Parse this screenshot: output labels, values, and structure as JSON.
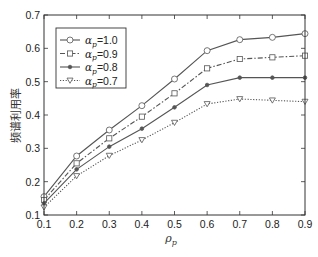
{
  "chart_data": {
    "type": "line",
    "title": "",
    "xlabel": "ρ_p",
    "ylabel": "频谱利用率",
    "x": [
      0.1,
      0.2,
      0.3,
      0.4,
      0.5,
      0.6,
      0.7,
      0.8,
      0.9
    ],
    "xlim": [
      0.1,
      0.9
    ],
    "ylim": [
      0.1,
      0.7
    ],
    "xticks": [
      "0.1",
      "0.2",
      "0.3",
      "0.4",
      "0.5",
      "0.6",
      "0.7",
      "0.8",
      "0.9"
    ],
    "yticks": [
      "0.1",
      "0.2",
      "0.3",
      "0.4",
      "0.5",
      "0.6",
      "0.7"
    ],
    "grid": false,
    "legend_position": "upper left",
    "series": [
      {
        "name": "α_p=1.0",
        "marker": "circle",
        "line": "solid",
        "values": [
          0.155,
          0.277,
          0.355,
          0.428,
          0.508,
          0.593,
          0.626,
          0.633,
          0.644
        ]
      },
      {
        "name": "α_p=0.9",
        "marker": "square",
        "line": "dashdot",
        "values": [
          0.145,
          0.255,
          0.33,
          0.395,
          0.465,
          0.54,
          0.568,
          0.573,
          0.578
        ]
      },
      {
        "name": "α_p=0.8",
        "marker": "dot",
        "line": "solid",
        "values": [
          0.135,
          0.237,
          0.305,
          0.359,
          0.423,
          0.49,
          0.512,
          0.512,
          0.512
        ]
      },
      {
        "name": "α_p=0.7",
        "marker": "triangle-down",
        "line": "dotted",
        "values": [
          0.123,
          0.217,
          0.278,
          0.325,
          0.377,
          0.433,
          0.448,
          0.444,
          0.44
        ]
      }
    ]
  },
  "labels": {
    "ylabel": "频谱利用率",
    "xlabel_main": "ρ",
    "xlabel_sub": "p",
    "legend": [
      {
        "sym": "α",
        "sub": "p",
        "value": "=1.0"
      },
      {
        "sym": "α",
        "sub": "p",
        "value": "=0.9"
      },
      {
        "sym": "α",
        "sub": "p",
        "value": "=0.8"
      },
      {
        "sym": "α",
        "sub": "p",
        "value": "=0.7"
      }
    ]
  },
  "colors": {
    "axis": "#333333",
    "line": "#555555",
    "background": "#ffffff"
  }
}
